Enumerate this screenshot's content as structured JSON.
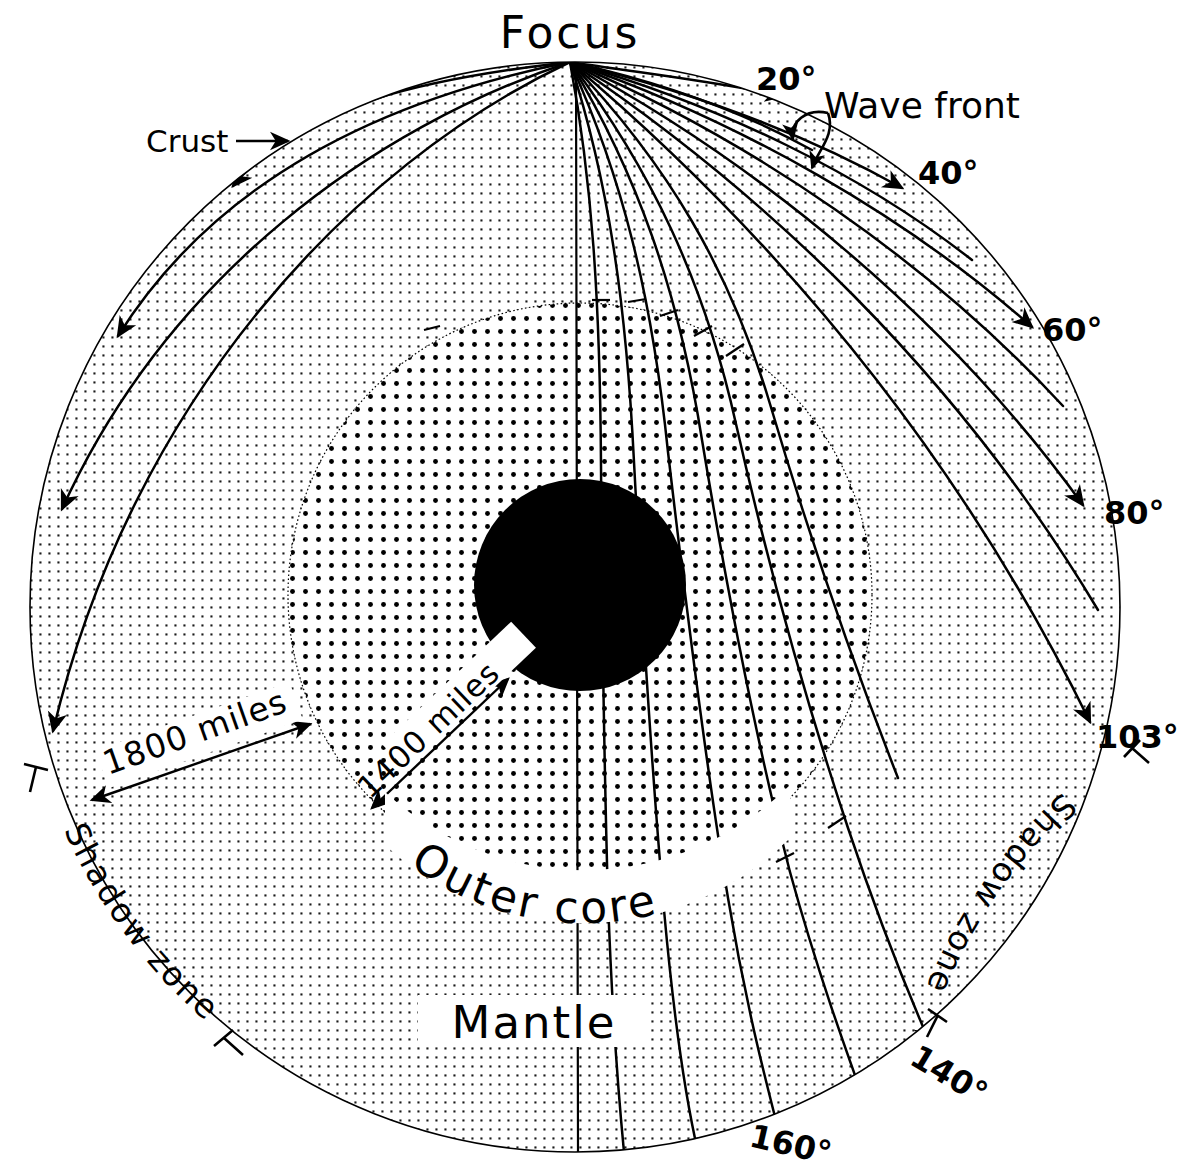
{
  "figure": {
    "type": "cross-section-diagram"
  },
  "labels": {
    "focus": "Focus",
    "crust": "Crust",
    "wave_front": "Wave front",
    "mantle": "Mantle",
    "outer_core": "Outer core",
    "shadow_zone_left": "Shadow zone",
    "shadow_zone_right": "Shadow zone",
    "dim_outer": "1800 miles",
    "dim_inner": "1400 miles"
  },
  "angles": [
    {
      "id": "a20",
      "text": "20°"
    },
    {
      "id": "a40",
      "text": "40°"
    },
    {
      "id": "a60",
      "text": "60°"
    },
    {
      "id": "a80",
      "text": "80°"
    },
    {
      "id": "a103",
      "text": "103°"
    },
    {
      "id": "a140",
      "text": "140°"
    },
    {
      "id": "a160",
      "text": "160°"
    }
  ],
  "colors": {
    "ink": "#000000",
    "paper": "#ffffff",
    "mantle_dots": "#1a1a1a",
    "core_dots": "#000000",
    "inner_core_fill": "#000000"
  },
  "geometry": {
    "earth_center": [
      575,
      607
    ],
    "earth_radius": 545,
    "outer_core_center": [
      580,
      595
    ],
    "outer_core_radius": 292,
    "inner_core_center": [
      580,
      585
    ],
    "inner_core_radius": 106,
    "focus": [
      570,
      62
    ]
  }
}
